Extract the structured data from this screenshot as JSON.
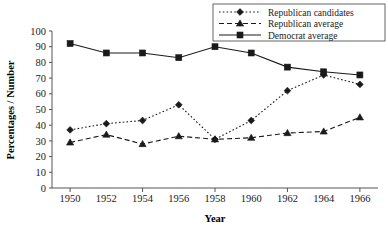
{
  "chart_data": {
    "type": "line",
    "title": "",
    "xlabel": "Year",
    "ylabel": "Percentages / Number",
    "x": [
      1950,
      1952,
      1954,
      1956,
      1958,
      1960,
      1962,
      1964,
      1966
    ],
    "xtick_labels": [
      "1950",
      "1952",
      "1954",
      "1956",
      "1958",
      "1960",
      "1962",
      "1964",
      "1966"
    ],
    "ytick_labels": [
      "0",
      "10",
      "20",
      "30",
      "40",
      "50",
      "60",
      "70",
      "80",
      "90",
      "100"
    ],
    "ylim": [
      0,
      100
    ],
    "ystep": 10,
    "grid": false,
    "legend_position": "top-right",
    "series": [
      {
        "name": "Republican candidates",
        "values": [
          37,
          41,
          43,
          53,
          31,
          43,
          62,
          72,
          66
        ],
        "line_style": "dotted",
        "marker": "diamond",
        "color": "#1a1a1a"
      },
      {
        "name": "Republican average",
        "values": [
          29,
          34,
          28,
          33,
          31,
          32,
          35,
          36,
          45
        ],
        "line_style": "dashed",
        "marker": "triangle",
        "color": "#1a1a1a"
      },
      {
        "name": "Democrat average",
        "values": [
          92,
          86,
          86,
          83,
          90,
          86,
          77,
          74,
          72
        ],
        "line_style": "solid",
        "marker": "square",
        "color": "#1a1a1a"
      }
    ]
  },
  "legend": {
    "items": [
      {
        "label": "Republican candidates"
      },
      {
        "label": "Republican average"
      },
      {
        "label": "Democrat average"
      }
    ]
  }
}
